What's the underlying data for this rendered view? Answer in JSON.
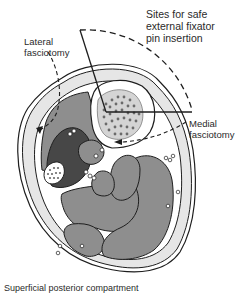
{
  "labels": {
    "sites": [
      "Sites for safe",
      "external fixator",
      "pin insertion"
    ],
    "lateral": [
      "Lateral",
      "fasciotomy"
    ],
    "medial": [
      "Medial",
      "fasciotomy"
    ],
    "caption": "Superficial posterior compartment"
  },
  "colors": {
    "skin": "#e6e6e6",
    "muscle": "#8e8e8e",
    "dark_compartment": "#474747",
    "bone": "#f2f2f2",
    "stroke": "#1e1e1e"
  }
}
